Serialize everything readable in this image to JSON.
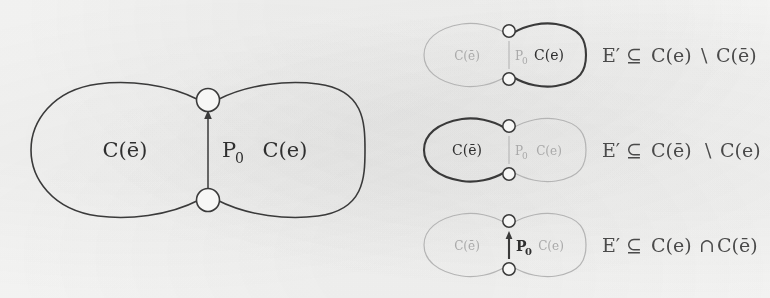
{
  "figure": {
    "background_color": "#f7f7f6",
    "ink_color": "#3a3a3a",
    "faint_ink_color": "#a9a9a9"
  },
  "main_diagram": {
    "left_region_label": "C(ē)",
    "right_region_label": "C(e)",
    "path_label": "P",
    "path_label_subscript": "0",
    "node_top_label": "",
    "node_bottom_label": ""
  },
  "cases": [
    {
      "left_region_label": "C(ē)",
      "right_region_label": "C(e)",
      "path_label": "P",
      "path_label_subscript": "0",
      "emphasis": "right-lobe",
      "formula": "E′ ⊆ C(e) \\ C(ē)",
      "formula_parts": {
        "set": "E′",
        "relation": "⊆",
        "operand_left": "C(e)",
        "operator": "\\",
        "operand_right": "C(ē)"
      }
    },
    {
      "left_region_label": "C(ē)",
      "right_region_label": "C(e)",
      "path_label": "P",
      "path_label_subscript": "0",
      "emphasis": "left-lobe",
      "formula": "E′ ⊆ C(ē) \\ C(e)",
      "formula_parts": {
        "set": "E′",
        "relation": "⊆",
        "operand_left": "C(ē)",
        "operator": "\\",
        "operand_right": "C(e)"
      }
    },
    {
      "left_region_label": "C(ē)",
      "right_region_label": "C(e)",
      "path_label": "P",
      "path_label_subscript": "0",
      "emphasis": "path",
      "formula": "E′ ⊆ C(e) ∩ C(ē)",
      "formula_parts": {
        "set": "E′",
        "relation": "⊆",
        "operand_left": "C(e)",
        "operator": "∩",
        "operand_right": "C(ē)"
      }
    }
  ]
}
